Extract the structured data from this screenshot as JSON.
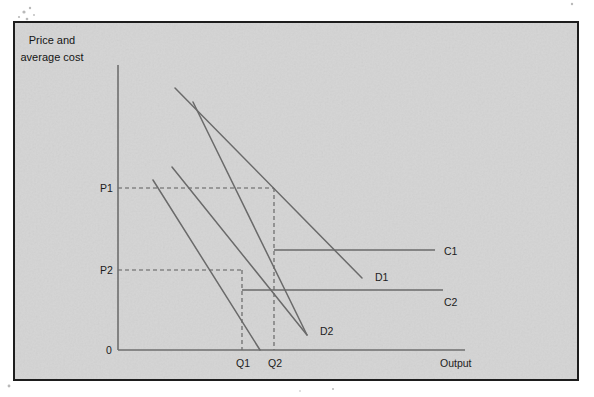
{
  "figure": {
    "background_color": "#d4d4d4",
    "page_color": "#ffffff",
    "frame_color": "#1d1d1d",
    "ink_color": "#6a6a6a",
    "text_color": "#1c1c1c"
  },
  "chart_data": {
    "type": "line",
    "title": "",
    "ylabel_line1": "Price and",
    "ylabel_line2": "average cost",
    "xlabel": "Output",
    "grid": false,
    "legend": "inline-end-labels",
    "axis_origin_label": "0",
    "y_tick_labels": [
      "P1",
      "P2"
    ],
    "x_tick_labels": [
      "Q1",
      "Q2"
    ],
    "y_ticks": [
      {
        "label": "P1",
        "value": 188
      },
      {
        "label": "P2",
        "value": 270
      }
    ],
    "x_ticks": [
      {
        "label": "Q1",
        "value": 242
      },
      {
        "label": "Q2",
        "value": 274
      }
    ],
    "series": [
      {
        "name": "D1",
        "label": "D1",
        "kind": "demand",
        "points": [
          [
            175,
            88
          ],
          [
            362,
            278
          ]
        ],
        "label_pos": [
          375,
          281
        ]
      },
      {
        "name": "D1-inner",
        "label": "",
        "kind": "demand",
        "points": [
          [
            193,
            102
          ],
          [
            307,
            335
          ]
        ],
        "label_pos": null
      },
      {
        "name": "D2",
        "label": "D2",
        "kind": "demand",
        "points": [
          [
            172,
            167
          ],
          [
            307,
            335
          ]
        ],
        "label_pos": [
          320,
          335
        ]
      },
      {
        "name": "D2-inner",
        "label": "",
        "kind": "demand",
        "points": [
          [
            153,
            180
          ],
          [
            260,
            350
          ]
        ],
        "label_pos": null
      },
      {
        "name": "C1",
        "label": "C1",
        "kind": "cost",
        "points": [
          [
            274,
            250
          ],
          [
            435,
            250
          ]
        ],
        "label_pos": [
          444,
          255
        ]
      },
      {
        "name": "C2",
        "label": "C2",
        "kind": "cost",
        "points": [
          [
            242,
            290
          ],
          [
            443,
            290
          ]
        ],
        "label_pos": [
          444,
          306
        ]
      }
    ],
    "guides": [
      {
        "name": "p1-horizontal",
        "points": [
          [
            118,
            188
          ],
          [
            274,
            188
          ]
        ]
      },
      {
        "name": "q2-vertical",
        "points": [
          [
            274,
            188
          ],
          [
            274,
            350
          ]
        ]
      },
      {
        "name": "p2-horizontal",
        "points": [
          [
            118,
            270
          ],
          [
            242,
            270
          ]
        ]
      },
      {
        "name": "q1-vertical",
        "points": [
          [
            242,
            270
          ],
          [
            242,
            350
          ]
        ]
      }
    ],
    "axes": {
      "y_axis": [
        [
          118,
          65
        ],
        [
          118,
          350
        ]
      ],
      "x_axis": [
        [
          118,
          350
        ],
        [
          465,
          350
        ]
      ]
    },
    "annotations": [
      {
        "name": "p1-label",
        "text": "P1",
        "pos": [
          100,
          192
        ]
      },
      {
        "name": "p2-label",
        "text": "P2",
        "pos": [
          100,
          274
        ]
      },
      {
        "name": "origin-label",
        "text": "0",
        "pos": [
          106,
          354
        ]
      },
      {
        "name": "q1-label",
        "text": "Q1",
        "pos": [
          236,
          367
        ]
      },
      {
        "name": "q2-label",
        "text": "Q2",
        "pos": [
          268,
          367
        ]
      },
      {
        "name": "output-label",
        "text": "Output",
        "pos": [
          440,
          367
        ]
      },
      {
        "name": "c1-label",
        "text": "C1",
        "pos": [
          444,
          255
        ]
      },
      {
        "name": "c2-label",
        "text": "C2",
        "pos": [
          444,
          306
        ]
      },
      {
        "name": "d1-label",
        "text": "D1",
        "pos": [
          375,
          281
        ]
      },
      {
        "name": "d2-label",
        "text": "D2",
        "pos": [
          320,
          335
        ]
      },
      {
        "name": "y-axis-title-line1",
        "text": "Price and",
        "pos": [
          52,
          44
        ]
      },
      {
        "name": "y-axis-title-line2",
        "text": "average cost",
        "pos": [
          52,
          61
        ]
      }
    ],
    "frame": {
      "x": 14,
      "y": 22,
      "width": 564,
      "height": 358
    }
  }
}
